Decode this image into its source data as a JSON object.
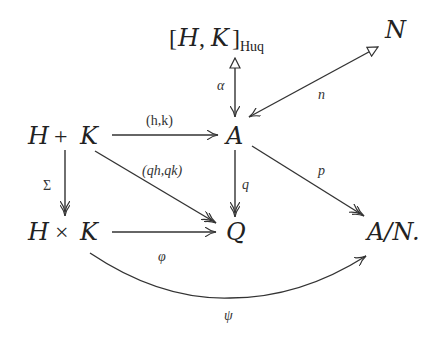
{
  "diagram": {
    "type": "commutative-diagram",
    "nodes": {
      "commutator": {
        "open": "[",
        "H": "H",
        "comma": ",",
        "K": "K",
        "close": "]",
        "subscript": "Huq"
      },
      "N": "N",
      "H_plus_K": {
        "H": "H",
        "op": "+",
        "K": "K"
      },
      "A": "A",
      "H_times_K": {
        "H": "H",
        "op": "×",
        "K": "K"
      },
      "Q": "Q",
      "A_mod_N": "A/N."
    },
    "arrows": [
      {
        "id": "alpha",
        "from": "[H,K]_Huq",
        "to": "A",
        "label": "α",
        "style": "mono"
      },
      {
        "id": "n",
        "from": "N",
        "to": "A",
        "label": "n",
        "style": "mono"
      },
      {
        "id": "hk",
        "from": "H+K",
        "to": "A",
        "label": "(h,k)",
        "style": "plain"
      },
      {
        "id": "qhqk",
        "from": "H+K",
        "to": "Q",
        "label": "(qh,qk)",
        "style": "epi"
      },
      {
        "id": "q",
        "from": "A",
        "to": "Q",
        "label": "q",
        "style": "epi"
      },
      {
        "id": "p",
        "from": "A",
        "to": "A/N",
        "label": "p",
        "style": "epi"
      },
      {
        "id": "sigma",
        "from": "H+K",
        "to": "H×K",
        "label": "Σ",
        "style": "epi"
      },
      {
        "id": "phi",
        "from": "H×K",
        "to": "Q",
        "label": "φ",
        "style": "plain"
      },
      {
        "id": "psi",
        "from": "H×K",
        "to": "A/N",
        "label": "ψ",
        "style": "plain-curved"
      }
    ],
    "labels": {
      "alpha": "α",
      "n": "n",
      "hk": "(h,k)",
      "qhqk": "(qh,qk)",
      "q": "q",
      "p": "p",
      "sigma": "Σ",
      "phi": "φ",
      "psi": "ψ"
    }
  }
}
